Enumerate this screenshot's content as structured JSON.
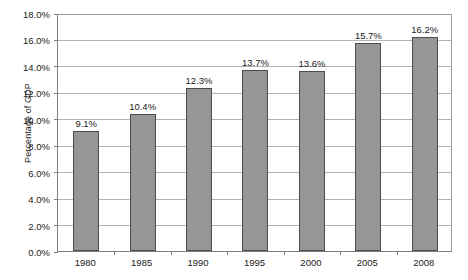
{
  "chart_data": {
    "type": "bar",
    "title": "",
    "subtitle": "",
    "xlabel": "",
    "ylabel": "Percentage of GDP",
    "categories": [
      "1980",
      "1985",
      "1990",
      "1995",
      "2000",
      "2005",
      "2008"
    ],
    "values": [
      9.1,
      10.4,
      12.3,
      13.7,
      13.6,
      15.7,
      16.2
    ],
    "data_labels": [
      "9.1%",
      "10.4%",
      "12.3%",
      "13.7%",
      "13.6%",
      "15.7%",
      "16.2%"
    ],
    "ylim": [
      0,
      18
    ],
    "ytick_values": [
      0.0,
      2.0,
      4.0,
      6.0,
      8.0,
      10.0,
      12.0,
      14.0,
      16.0,
      18.0
    ],
    "ytick_labels": [
      "0.0%",
      "2.0%",
      "4.0%",
      "6.0%",
      "8.0%",
      "10.0%",
      "12.0%",
      "14.0%",
      "16.0%",
      "18.0%"
    ],
    "grid": true,
    "legend": false,
    "legend_position": "none",
    "series": [
      {
        "name": "",
        "values": [
          9.1,
          10.4,
          12.3,
          13.7,
          13.6,
          15.7,
          16.2
        ]
      }
    ],
    "colors": {
      "bar_fill": "#969696",
      "bar_border": "#4d4d4d",
      "gridline": "#b3b3b3",
      "axis": "#808080",
      "text": "#1a1a1a",
      "background": "#ffffff"
    }
  }
}
